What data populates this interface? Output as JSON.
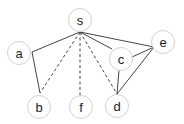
{
  "diagram": {
    "type": "graph",
    "node_radius": 11.5,
    "nodes": [
      {
        "id": "s",
        "label": "s",
        "x": 80,
        "y": 20
      },
      {
        "id": "a",
        "label": "a",
        "x": 19,
        "y": 53
      },
      {
        "id": "b",
        "label": "b",
        "x": 39,
        "y": 107
      },
      {
        "id": "f",
        "label": "f",
        "x": 81,
        "y": 107
      },
      {
        "id": "d",
        "label": "d",
        "x": 117,
        "y": 106
      },
      {
        "id": "c",
        "label": "c",
        "x": 121,
        "y": 59
      },
      {
        "id": "e",
        "label": "e",
        "x": 163,
        "y": 42
      }
    ],
    "edges": [
      {
        "from": "s",
        "to": "a",
        "style": "solid",
        "x1": 80,
        "y1": 32,
        "x2": 32,
        "y2": 52
      },
      {
        "from": "a",
        "to": "b",
        "style": "solid",
        "x1": 32,
        "y1": 52,
        "x2": 40,
        "y2": 93
      },
      {
        "from": "s",
        "to": "b",
        "style": "dashed",
        "x1": 80,
        "y1": 32,
        "x2": 40,
        "y2": 93
      },
      {
        "from": "s",
        "to": "f",
        "style": "dashed",
        "x1": 80,
        "y1": 32,
        "x2": 80,
        "y2": 95
      },
      {
        "from": "s",
        "to": "d",
        "style": "dashed",
        "x1": 80,
        "y1": 32,
        "x2": 117,
        "y2": 94
      },
      {
        "from": "s",
        "to": "c",
        "style": "solid",
        "x1": 80,
        "y1": 32,
        "x2": 112,
        "y2": 49
      },
      {
        "from": "s",
        "to": "e",
        "style": "solid",
        "x1": 80,
        "y1": 32,
        "x2": 154,
        "y2": 47
      },
      {
        "from": "c",
        "to": "e",
        "style": "solid",
        "x1": 132,
        "y1": 57,
        "x2": 154,
        "y2": 47
      },
      {
        "from": "c",
        "to": "d",
        "style": "solid",
        "x1": 119,
        "y1": 70,
        "x2": 117,
        "y2": 94
      },
      {
        "from": "e",
        "to": "d",
        "style": "solid",
        "x1": 154,
        "y1": 47,
        "x2": 117,
        "y2": 94
      }
    ],
    "colors": {
      "node_stroke": "#d2d2d2",
      "node_fill": "#ffffff",
      "edge": "#444444",
      "label": "#222222"
    }
  }
}
